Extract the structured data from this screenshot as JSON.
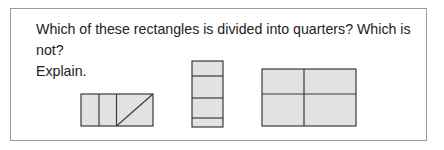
{
  "question": {
    "line1": "Which of these rectangles is divided into quarters? Which is not?",
    "line2": "Explain."
  },
  "colors": {
    "border": "#9a9a9a",
    "shape_fill": "#e2e2e2",
    "shape_stroke": "#3a3a3a",
    "text": "#222222"
  },
  "figures": [
    {
      "id": "rectangle-a",
      "description": "Wide rectangle split by two vertical lines into three columns; the rightmost column is split by a diagonal into two triangles",
      "parts": 4
    },
    {
      "id": "rectangle-b",
      "description": "Tall rectangle split by three horizontal lines into four unequal strips",
      "parts": 4
    },
    {
      "id": "rectangle-c",
      "description": "Wide rectangle split by one vertical and one horizontal line into four parts",
      "parts": 4
    }
  ]
}
